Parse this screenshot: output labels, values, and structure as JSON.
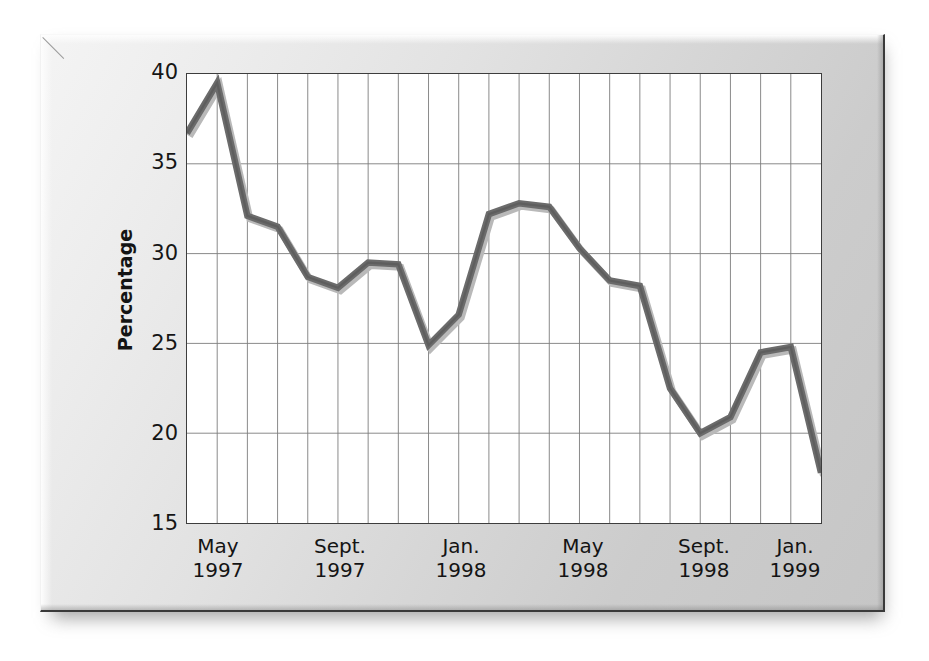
{
  "chart_data": {
    "type": "line",
    "title": "",
    "subtitle": "",
    "xlabel": "",
    "ylabel": "Percentage",
    "ylim": [
      15,
      40
    ],
    "yticks": [
      40,
      35,
      30,
      25,
      20,
      15
    ],
    "grid": true,
    "legend": false,
    "legend_position": "none",
    "xtick_labels": [
      {
        "month": "May",
        "year": "1997"
      },
      {
        "month": "Sept.",
        "year": "1997"
      },
      {
        "month": "Jan.",
        "year": "1998"
      },
      {
        "month": "May",
        "year": "1998"
      },
      {
        "month": "Sept.",
        "year": "1998"
      },
      {
        "month": "Jan.",
        "year": "1999"
      }
    ],
    "x": [
      "May 1997",
      "Jun 1997",
      "Jul 1997",
      "Aug 1997",
      "Sept. 1997",
      "Oct 1997",
      "Nov 1997",
      "Dec 1997",
      "Jan. 1998",
      "Feb 1998",
      "Mar 1998",
      "Apr 1998",
      "May 1998",
      "Jun 1998",
      "Jul 1998",
      "Aug 1998",
      "Sept. 1998",
      "Oct 1998",
      "Nov 1998",
      "Dec 1998",
      "Jan. 1999",
      "Feb 1999"
    ],
    "series": [
      {
        "name": "Percentage",
        "color": "#6b6b6b",
        "values": [
          36.7,
          39.5,
          32.1,
          31.5,
          28.7,
          28.1,
          29.5,
          29.4,
          24.9,
          26.6,
          32.2,
          32.8,
          32.6,
          30.3,
          28.5,
          28.2,
          22.5,
          20.0,
          20.9,
          24.5,
          24.8,
          17.8
        ]
      }
    ]
  },
  "axes": {
    "y_tick_labels": [
      "40",
      "35",
      "30",
      "25",
      "20",
      "15"
    ]
  },
  "icons": {
    "chart_frame": "chart-frame"
  }
}
